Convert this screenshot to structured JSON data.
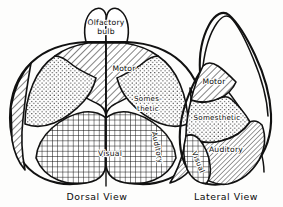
{
  "figure": {
    "background_color": "#fdfdfc",
    "ink_color": "#111111",
    "views": [
      {
        "id": "dorsal",
        "caption": "Dorsal View",
        "labels": [
          {
            "id": "olfactory-bulb",
            "line1": "Olfactory",
            "line2": "bulb",
            "pattern": "blank"
          },
          {
            "id": "motor",
            "text": "Motor",
            "pattern": "diagonal-hatch"
          },
          {
            "id": "somesthetic",
            "line1": "Somes-",
            "line2": "thetic",
            "pattern": "stipple"
          },
          {
            "id": "visual",
            "text": "Visual",
            "pattern": "crosshatch"
          },
          {
            "id": "auditory",
            "text": "Auditory",
            "pattern": "fine-diagonal-hatch",
            "orientation": "vertical"
          }
        ]
      },
      {
        "id": "lateral",
        "caption": "Lateral View",
        "labels": [
          {
            "id": "motor",
            "text": "Motor",
            "pattern": "diagonal-hatch"
          },
          {
            "id": "somesthetic",
            "text": "Somesthetic",
            "pattern": "stipple"
          },
          {
            "id": "auditory",
            "text": "Auditory",
            "pattern": "fine-diagonal-hatch"
          },
          {
            "id": "visual",
            "text": "Visual",
            "pattern": "crosshatch",
            "orientation": "rotated"
          }
        ]
      }
    ]
  }
}
